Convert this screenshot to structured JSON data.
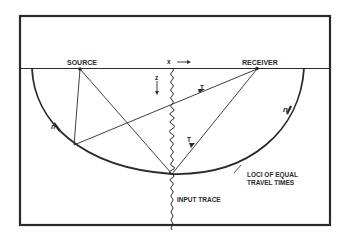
{
  "diagram": {
    "labels": {
      "source": "SOURCE",
      "receiver": "RECEIVER",
      "x_axis": "x",
      "z_axis": "z",
      "ray_t_upper": "T",
      "ray_t_lower": "T",
      "loci_line1": "LOCI OF EQUAL",
      "loci_line2": "TRAVEL TIMES",
      "input_trace": "INPUT TRACE",
      "normal_left": "n",
      "normal_right": "n"
    },
    "colors": {
      "ink": "#2a2a2a",
      "background": "#ffffff"
    }
  }
}
